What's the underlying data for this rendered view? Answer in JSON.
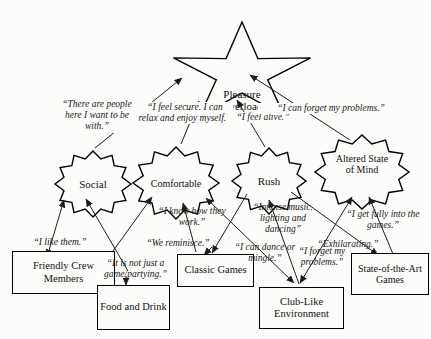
{
  "diagram": {
    "core_value": {
      "label": "Pleasure Overload"
    },
    "consequences": [
      {
        "id": "social",
        "label": "Social"
      },
      {
        "id": "comfortable",
        "label": "Comfortable"
      },
      {
        "id": "rush",
        "label": "Rush"
      },
      {
        "id": "altered",
        "label": "Altered State of Mind"
      }
    ],
    "attributes": [
      {
        "id": "crew",
        "label": "Friendly Crew Members"
      },
      {
        "id": "food",
        "label": "Food and Drink"
      },
      {
        "id": "classic",
        "label": "Classic Games"
      },
      {
        "id": "club",
        "label": "Club-Like Environment"
      },
      {
        "id": "sota",
        "label": "State-of-the-Art Games"
      }
    ],
    "quotes": [
      {
        "text": "“There are people here I want to be with.”"
      },
      {
        "text": "“I feel secure. I can relax and enjoy myself.”"
      },
      {
        "text": "“I feel alive.”"
      },
      {
        "text": "“I can forget my problems.”"
      },
      {
        "text": "“I like them.”"
      },
      {
        "text": "“It is not just a game/partying.”"
      },
      {
        "text": "“I know how they work.”"
      },
      {
        "text": "“We reminisce.”"
      },
      {
        "text": "“Intense music. lighting and dancing”"
      },
      {
        "text": "“I can dance or mingle.”"
      },
      {
        "text": "“Exhilarating.”"
      },
      {
        "text": "“I forget my problems.”"
      },
      {
        "text": "“I get fully into the games.”"
      }
    ],
    "colors": {
      "ink": "#1c1c1c",
      "background": "#fcfcfa"
    }
  }
}
